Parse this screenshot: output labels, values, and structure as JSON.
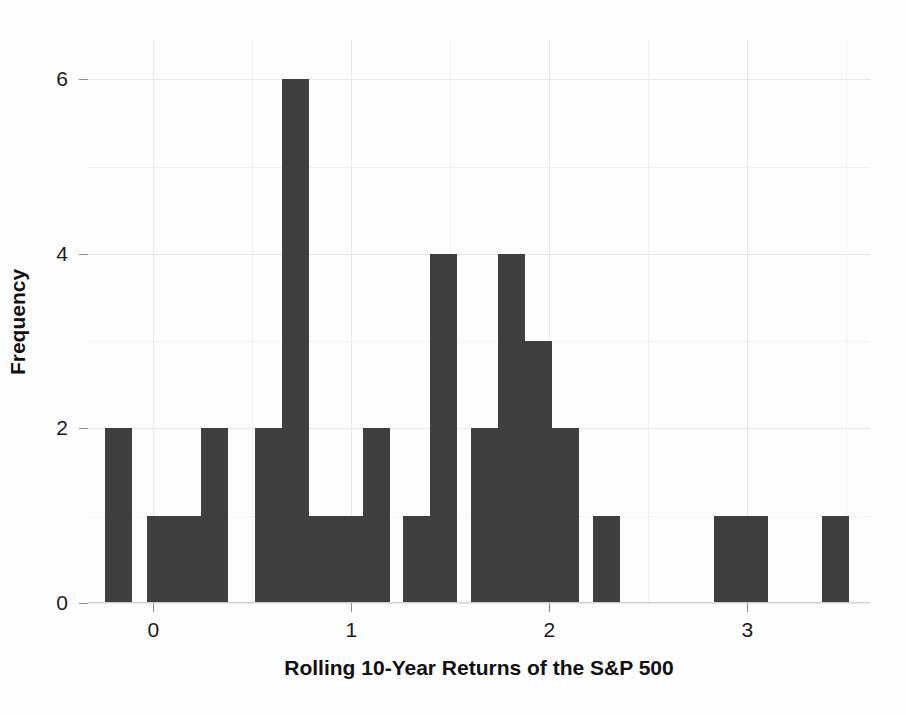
{
  "chart_data": {
    "type": "bar",
    "title": "",
    "xlabel": "Rolling 10-Year Returns of the S&P 500",
    "ylabel": "Frequency",
    "xlim": [
      -0.33,
      3.62
    ],
    "ylim": [
      0,
      6.45
    ],
    "xticks": [
      0,
      1,
      2,
      3
    ],
    "xtick_labels": [
      "0",
      "1",
      "2",
      "3"
    ],
    "yticks": [
      0,
      2,
      4,
      6
    ],
    "ytick_labels": [
      "0",
      "2",
      "4",
      "6"
    ],
    "grid": true,
    "legend": "none",
    "bar_color": "#3f3f3f",
    "bin_width": 0.1365,
    "bins": [
      {
        "left": -0.244,
        "center": -0.1758,
        "value": 2
      },
      {
        "left": -0.0345,
        "center": 0.0338,
        "value": 1
      },
      {
        "left": 0.102,
        "center": 0.1703,
        "value": 1
      },
      {
        "left": 0.2385,
        "center": 0.3068,
        "value": 2
      },
      {
        "left": 0.5115,
        "center": 0.5798,
        "value": 2
      },
      {
        "left": 0.648,
        "center": 0.7163,
        "value": 6
      },
      {
        "left": 0.7845,
        "center": 0.8528,
        "value": 1
      },
      {
        "left": 0.921,
        "center": 0.9893,
        "value": 1
      },
      {
        "left": 1.0575,
        "center": 1.1258,
        "value": 2
      },
      {
        "left": 1.2625,
        "center": 1.3308,
        "value": 1
      },
      {
        "left": 1.399,
        "center": 1.4673,
        "value": 4
      },
      {
        "left": 1.604,
        "center": 1.6723,
        "value": 2
      },
      {
        "left": 1.7405,
        "center": 1.8088,
        "value": 4
      },
      {
        "left": 1.877,
        "center": 1.9453,
        "value": 3
      },
      {
        "left": 2.0135,
        "center": 2.0818,
        "value": 2
      },
      {
        "left": 2.2185,
        "center": 2.2868,
        "value": 1
      },
      {
        "left": 2.833,
        "center": 2.9013,
        "value": 1
      },
      {
        "left": 2.9695,
        "center": 3.0378,
        "value": 1
      },
      {
        "left": 3.379,
        "center": 3.4473,
        "value": 1
      }
    ]
  },
  "axes": {
    "x_label_text": "Rolling 10-Year Returns of the S&P 500",
    "y_label_text": "Frequency"
  }
}
